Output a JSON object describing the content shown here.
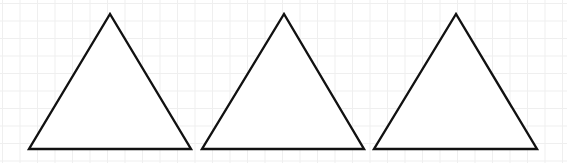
{
  "diagram": {
    "background": "#ffffff",
    "grid_color": "#efefef",
    "stroke_color": "#111111",
    "fill_color": "#ffffff",
    "shapes": [
      {
        "type": "triangle",
        "points": [
          [
            110,
            14
          ],
          [
            29,
            149
          ],
          [
            191,
            149
          ]
        ]
      },
      {
        "type": "triangle",
        "points": [
          [
            284,
            14
          ],
          [
            202,
            149
          ],
          [
            364,
            149
          ]
        ]
      },
      {
        "type": "triangle",
        "points": [
          [
            456,
            14
          ],
          [
            374,
            149
          ],
          [
            537,
            149
          ]
        ]
      }
    ]
  }
}
